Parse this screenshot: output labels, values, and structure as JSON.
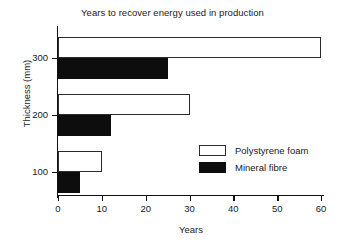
{
  "chart_data": {
    "type": "bar",
    "orientation": "horizontal",
    "title": "Years to recover energy used in production",
    "xlabel": "Years",
    "ylabel": "Thickness (mm)",
    "categories": [
      "100",
      "200",
      "300"
    ],
    "xlim": [
      0,
      60
    ],
    "xticks": [
      0,
      10,
      20,
      30,
      40,
      50,
      60
    ],
    "yticks": [
      100,
      200,
      300
    ],
    "grid": false,
    "legend_position": "center-right",
    "series": [
      {
        "name": "Polystyrene foam",
        "fill": "#ffffff",
        "edge": "#2b2b2b",
        "values": [
          10,
          30,
          60
        ]
      },
      {
        "name": "Mineral fibre",
        "fill": "#0d0d0d",
        "edge": "#0d0d0d",
        "values": [
          5,
          12,
          25
        ]
      }
    ]
  },
  "axes": {
    "x_tick_labels": [
      "0",
      "10",
      "20",
      "30",
      "40",
      "50",
      "60"
    ],
    "y_tick_labels": [
      "300",
      "200",
      "100"
    ]
  },
  "legend": {
    "items": [
      {
        "label": "Polystyrene foam",
        "style": "open"
      },
      {
        "label": "Mineral fibre",
        "style": "filled"
      }
    ]
  }
}
